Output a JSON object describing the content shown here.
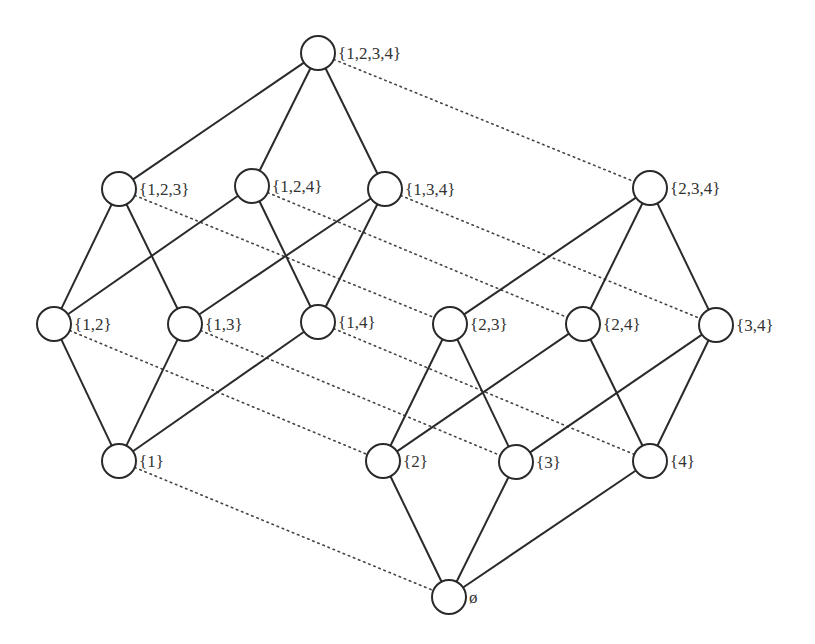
{
  "diagram": {
    "node_radius": 17,
    "colors": {
      "line": "#2a2a2a",
      "dotted": "#444444",
      "text": "#333333",
      "fill": "#ffffff"
    },
    "nodes": [
      {
        "id": "1234",
        "label": "{1,2,3,4}",
        "x": 318,
        "y": 53
      },
      {
        "id": "123",
        "label": "{1,2,3}",
        "x": 119,
        "y": 189
      },
      {
        "id": "124",
        "label": "{1,2,4}",
        "x": 252,
        "y": 186
      },
      {
        "id": "134",
        "label": "{1,3,4}",
        "x": 385,
        "y": 189
      },
      {
        "id": "234",
        "label": "{2,3,4}",
        "x": 650,
        "y": 188
      },
      {
        "id": "12",
        "label": "{1,2}",
        "x": 54,
        "y": 324
      },
      {
        "id": "13",
        "label": "{1,3}",
        "x": 185,
        "y": 324
      },
      {
        "id": "14",
        "label": "{1,4}",
        "x": 318,
        "y": 322
      },
      {
        "id": "23",
        "label": "{2,3}",
        "x": 450,
        "y": 324
      },
      {
        "id": "24",
        "label": "{2,4}",
        "x": 583,
        "y": 324
      },
      {
        "id": "34",
        "label": "{3,4}",
        "x": 716,
        "y": 325
      },
      {
        "id": "1",
        "label": "{1}",
        "x": 119,
        "y": 461
      },
      {
        "id": "2",
        "label": "{2}",
        "x": 383,
        "y": 461
      },
      {
        "id": "3",
        "label": "{3}",
        "x": 516,
        "y": 462
      },
      {
        "id": "4",
        "label": "{4}",
        "x": 650,
        "y": 461
      },
      {
        "id": "0",
        "label": "ø",
        "x": 449,
        "y": 597
      }
    ],
    "solid_edges": [
      [
        "1234",
        "123"
      ],
      [
        "1234",
        "124"
      ],
      [
        "1234",
        "134"
      ],
      [
        "123",
        "12"
      ],
      [
        "123",
        "13"
      ],
      [
        "124",
        "12"
      ],
      [
        "124",
        "14"
      ],
      [
        "134",
        "13"
      ],
      [
        "134",
        "14"
      ],
      [
        "12",
        "1"
      ],
      [
        "13",
        "1"
      ],
      [
        "14",
        "1"
      ],
      [
        "234",
        "23"
      ],
      [
        "234",
        "24"
      ],
      [
        "234",
        "34"
      ],
      [
        "23",
        "2"
      ],
      [
        "23",
        "3"
      ],
      [
        "24",
        "2"
      ],
      [
        "24",
        "4"
      ],
      [
        "34",
        "3"
      ],
      [
        "34",
        "4"
      ],
      [
        "2",
        "0"
      ],
      [
        "3",
        "0"
      ],
      [
        "4",
        "0"
      ]
    ],
    "dotted_edges": [
      [
        "1234",
        "234"
      ],
      [
        "123",
        "23"
      ],
      [
        "124",
        "24"
      ],
      [
        "134",
        "34"
      ],
      [
        "12",
        "2"
      ],
      [
        "13",
        "3"
      ],
      [
        "14",
        "4"
      ],
      [
        "1",
        "0"
      ]
    ]
  }
}
